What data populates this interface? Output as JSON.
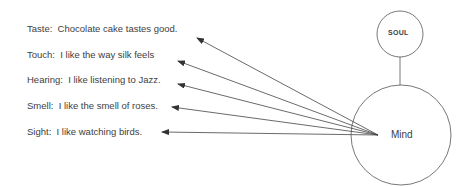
{
  "senses": [
    {
      "sense": "Taste",
      "text": "Taste:  Chocolate cake tastes good.",
      "x": 27,
      "y": 23,
      "arrow_tip": [
        197,
        38
      ]
    },
    {
      "sense": "Touch",
      "text": "Touch:  I like the way silk feels",
      "x": 27,
      "y": 49,
      "arrow_tip": [
        178,
        61
      ]
    },
    {
      "sense": "Hearing",
      "text": "Hearing:  I like listening to Jazz.",
      "x": 27,
      "y": 74,
      "arrow_tip": [
        178,
        84
      ]
    },
    {
      "sense": "Smell",
      "text": "Smell:  I like the smell of roses.",
      "x": 27,
      "y": 9999,
      "arrow_tip": [
        172,
        107
      ]
    },
    {
      "sense": "Sight",
      "text": "Sight:  I like watching birds.",
      "x": 27,
      "y": 126,
      "arrow_tip": [
        162,
        132
      ]
    }
  ],
  "nodes": {
    "soul": {
      "label": "SOUL",
      "cx": 400,
      "cy": 34,
      "r": 23
    },
    "mind": {
      "label": "Mind",
      "cx": 401,
      "cy": 135,
      "r": 50
    }
  },
  "edges": {
    "soul_to_mind": {
      "from": [
        400,
        57
      ],
      "to": [
        400,
        85
      ]
    },
    "origin": [
      378,
      135
    ]
  },
  "colors": {
    "line": "#404040",
    "text": "#404040",
    "background": "#ffffff"
  }
}
